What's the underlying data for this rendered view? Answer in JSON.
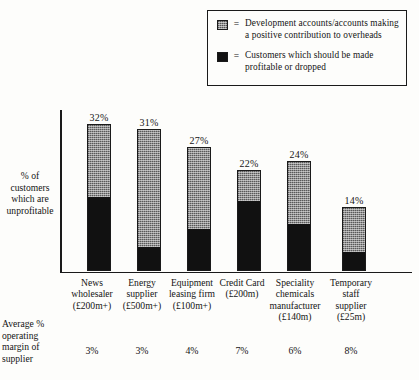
{
  "legend": {
    "equals": "=",
    "items": [
      {
        "swatch": "grey-swatch",
        "label": "Development accounts/accounts making a positive contribution to overheads"
      },
      {
        "swatch": "black-swatch",
        "label": "Customers which should be made profitable or dropped"
      }
    ]
  },
  "axis": {
    "ylabel": "% of customers which are unprofitable",
    "margin_label": "Average % operating margin of supplier"
  },
  "chart_data": {
    "type": "bar",
    "title": "",
    "xlabel": "",
    "ylabel": "% of customers which are unprofitable",
    "ylim": [
      0,
      35
    ],
    "grid": false,
    "stacked": true,
    "legend_position": "top-right",
    "categories": [
      "News wholesaler (£200m+)",
      "Energy supplier (£500m+)",
      "Equipment leasing firm (£100m+)",
      "Credit Card (£200m)",
      "Speciality chemicals manufacturer (£140m)",
      "Temporary staff supplier (£25m)"
    ],
    "category_lines": [
      [
        "News",
        "wholesaler",
        "(£200m+)"
      ],
      [
        "Energy",
        "supplier",
        "(£500m+)"
      ],
      [
        "Equipment",
        "leasing firm",
        "(£100m+)"
      ],
      [
        "Credit Card",
        "(£200m)"
      ],
      [
        "Speciality",
        "chemicals",
        "manufacturer",
        "(£140m)"
      ],
      [
        "Temporary",
        "staff",
        "supplier",
        "(£25m)"
      ]
    ],
    "totals": [
      32,
      31,
      27,
      22,
      24,
      14
    ],
    "total_labels": [
      "32%",
      "31%",
      "27%",
      "22%",
      "24%",
      "14%"
    ],
    "series": [
      {
        "name": "Development accounts/accounts making a positive contribution to overheads",
        "color": "#8f8f8f",
        "values": [
          16,
          26,
          18,
          7,
          14,
          10
        ]
      },
      {
        "name": "Customers which should be made profitable or dropped",
        "color": "#111111",
        "values": [
          16,
          5,
          9,
          15,
          10,
          4
        ]
      }
    ],
    "annotations": {
      "margin_row_label": "Average % operating margin of supplier",
      "margin_values": [
        "3%",
        "3%",
        "4%",
        "7%",
        "6%",
        "8%"
      ]
    }
  }
}
